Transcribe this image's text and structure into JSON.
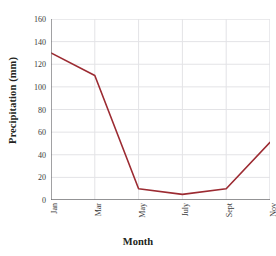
{
  "chart_data": {
    "type": "line",
    "title": "",
    "xlabel": "Month",
    "ylabel": "Precipitation (mm)",
    "categories": [
      "Jan",
      "Mar",
      "May",
      "July",
      "Sept",
      "Nov"
    ],
    "values": [
      130,
      110,
      10,
      5,
      10,
      51
    ],
    "series": [
      {
        "name": "Precipitation",
        "values": [
          130,
          110,
          10,
          5,
          10,
          51
        ],
        "color": "#9c2b32"
      }
    ],
    "ylim": [
      0,
      160
    ],
    "xlim": [
      0,
      5
    ],
    "y_ticks": [
      0,
      20,
      40,
      60,
      80,
      100,
      120,
      140,
      160
    ],
    "y_tick_labels": [
      "0",
      "20",
      "40",
      "60",
      "80",
      "100",
      "120",
      "140",
      "160"
    ],
    "x_tick_labels": [
      "Jan",
      "Mar",
      "May",
      "July",
      "Sept",
      "Nov"
    ],
    "x_tick_rotation": 90,
    "grid": true,
    "grid_color": "#e3e3e6",
    "legend": false,
    "legend_position": "none",
    "axis_color": "#6f6f72",
    "line_width": 1.6,
    "markers": false
  },
  "figure": {
    "background": "#ffffff",
    "text_color": "#231f20",
    "tick_color": "#3a3a3a"
  }
}
